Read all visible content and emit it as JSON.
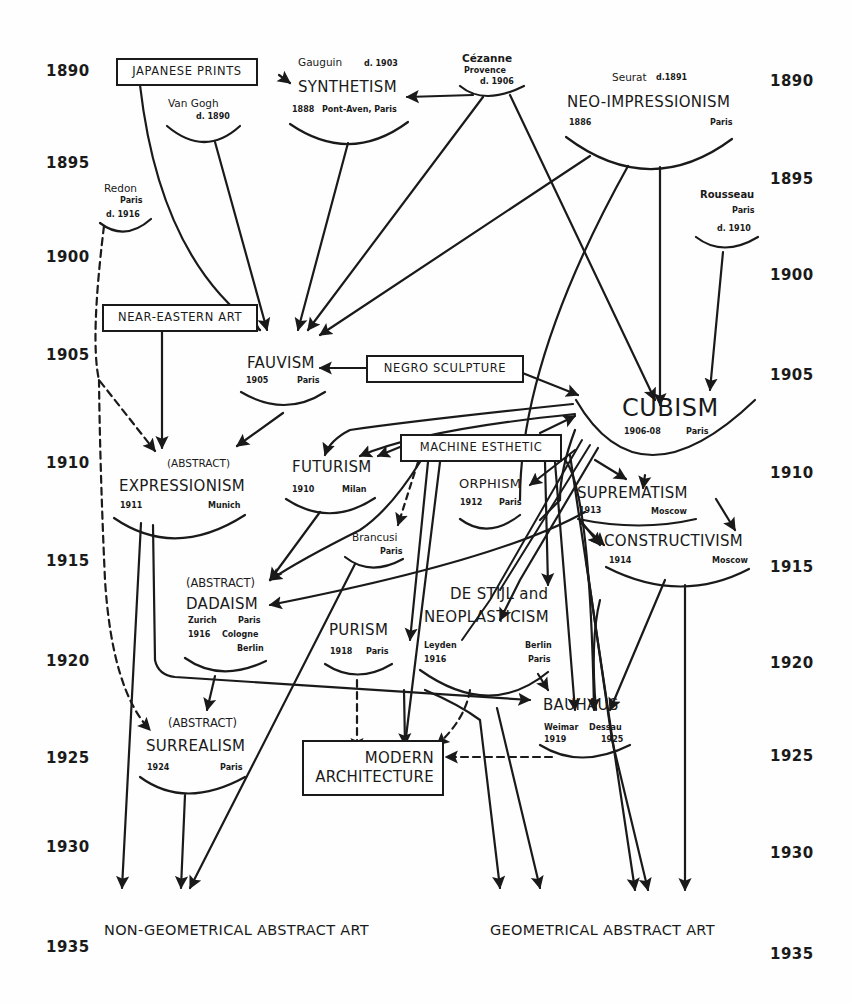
{
  "diagram": {
    "type": "flowchart-timeline",
    "ink_color": "#1a1a1a",
    "background_color": "#fefefe"
  },
  "years_left": [
    "1890",
    "1895",
    "1900",
    "1905",
    "1910",
    "1915",
    "1920",
    "1925",
    "1930",
    "1935"
  ],
  "years_right": [
    "1890",
    "1895",
    "1900",
    "1905",
    "1910",
    "1915",
    "1920",
    "1925",
    "1930",
    "1935"
  ],
  "sources": {
    "japanese_prints": "JAPANESE PRINTS",
    "near_eastern_art": "NEAR-EASTERN ART",
    "negro_sculpture": "NEGRO SCULPTURE",
    "machine_esthetic": "MACHINE ESTHETIC",
    "modern_architecture": [
      "MODERN",
      "ARCHITECTURE"
    ]
  },
  "artists": {
    "van_gogh": {
      "name": "Van Gogh",
      "detail": "d. 1890"
    },
    "gauguin": {
      "name": "Gauguin",
      "detail": "d. 1903"
    },
    "cezanne": {
      "name": "Cézanne",
      "place": "Provence",
      "detail": "d. 1906"
    },
    "seurat": {
      "name": "Seurat",
      "detail": "d.1891"
    },
    "redon": {
      "name": "Redon",
      "place": "Paris",
      "detail": "d. 1916"
    },
    "rousseau": {
      "name": "Rousseau",
      "place": "Paris",
      "detail": "d. 1910"
    },
    "brancusi": {
      "name": "Brancusi",
      "place": "Paris"
    }
  },
  "movements": {
    "synthetism": {
      "name": "SYNTHETISM",
      "year": "1888",
      "place": "Pont-Aven, Paris"
    },
    "neo_impressionism": {
      "name": "NEO-IMPRESSIONISM",
      "year": "1886",
      "place": "Paris"
    },
    "fauvism": {
      "name": "FAUVISM",
      "year": "1905",
      "place": "Paris"
    },
    "cubism": {
      "name": "CUBISM",
      "year": "1906-08",
      "place": "Paris"
    },
    "expressionism": {
      "prefix": "(ABSTRACT)",
      "name": "EXPRESSIONISM",
      "year": "1911",
      "place": "Munich"
    },
    "futurism": {
      "name": "FUTURISM",
      "year": "1910",
      "place": "Milan"
    },
    "orphism": {
      "name": "ORPHISM",
      "year": "1912",
      "place": "Paris"
    },
    "suprematism": {
      "name": "SUPREMATISM",
      "year": "1913",
      "place": "Moscow"
    },
    "constructivism": {
      "name": "CONSTRUCTIVISM",
      "year": "1914",
      "place": "Moscow"
    },
    "dadaism": {
      "prefix": "(ABSTRACT)",
      "name": "DADAISM",
      "place1": "Zurich",
      "place2": "Paris",
      "year": "1916",
      "place3": "Cologne",
      "place4": "Berlin"
    },
    "purism": {
      "name": "PURISM",
      "year": "1918",
      "place": "Paris"
    },
    "de_stijl": {
      "name1": "DE STIJL and",
      "name2": "NEOPLASTICISM",
      "place1": "Leyden",
      "year": "1916",
      "place2": "Berlin",
      "place3": "Paris"
    },
    "bauhaus": {
      "name": "BAUHAUS",
      "place1": "Weimar",
      "place2": "Dessau",
      "year1": "1919",
      "year2": "1925"
    },
    "surrealism": {
      "prefix": "(ABSTRACT)",
      "name": "SURREALISM",
      "year": "1924",
      "place": "Paris"
    }
  },
  "outcomes": {
    "non_geometrical": "NON-GEOMETRICAL ABSTRACT ART",
    "geometrical": "GEOMETRICAL ABSTRACT ART"
  }
}
